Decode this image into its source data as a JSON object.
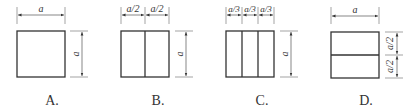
{
  "diagram": {
    "options": [
      {
        "label": "A.",
        "divisions": "none",
        "top_dims": [
          "a"
        ],
        "side_dims": [
          "a"
        ]
      },
      {
        "label": "B.",
        "divisions": "2 vertical strips",
        "top_dims": [
          "a/2",
          "a/2"
        ],
        "side_dims": [
          "a"
        ]
      },
      {
        "label": "C.",
        "divisions": "3 vertical strips",
        "top_dims": [
          "a/3",
          "a/3",
          "a/3"
        ],
        "side_dims": [
          "a"
        ]
      },
      {
        "label": "D.",
        "divisions": "2 horizontal strips",
        "top_dims": [
          "a"
        ],
        "side_dims": [
          "a/2",
          "a/2"
        ]
      }
    ],
    "colors": {
      "stroke": "#333333",
      "background": "#ffffff"
    }
  }
}
